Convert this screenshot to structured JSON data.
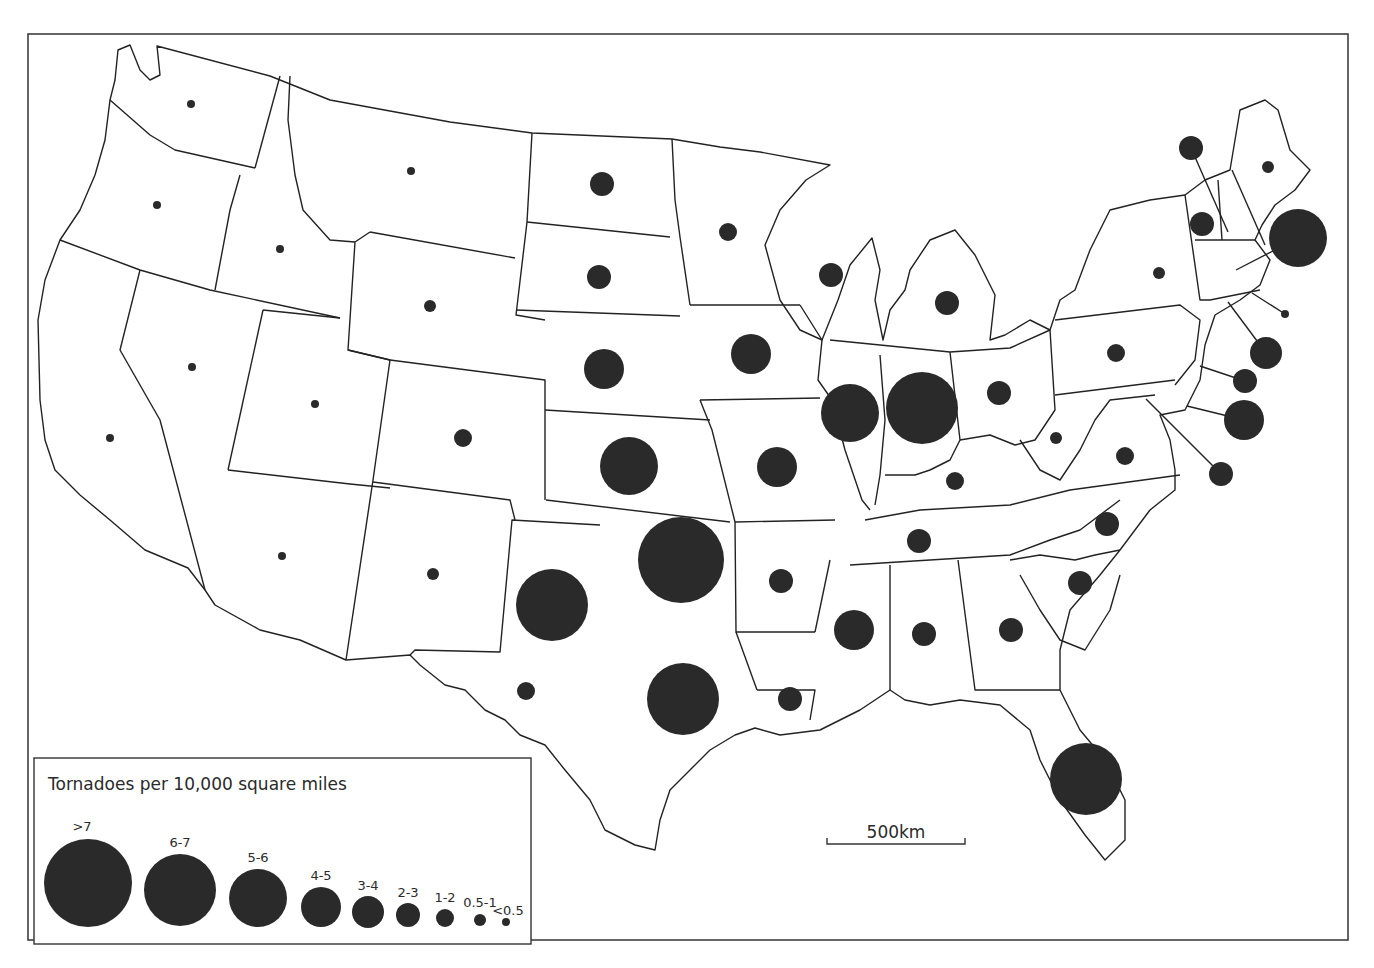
{
  "legend": {
    "title": "Tornadoes per 10,000 square miles",
    "classes": [
      {
        "label": ">7",
        "cx": 88,
        "cy": 883,
        "r": 44,
        "lx": 82,
        "ly": 831
      },
      {
        "label": "6-7",
        "cx": 180,
        "cy": 890,
        "r": 36,
        "lx": 180,
        "ly": 847
      },
      {
        "label": "5-6",
        "cx": 258,
        "cy": 898,
        "r": 29,
        "lx": 258,
        "ly": 862
      },
      {
        "label": "4-5",
        "cx": 321,
        "cy": 907,
        "r": 20,
        "lx": 321,
        "ly": 880
      },
      {
        "label": "3-4",
        "cx": 368,
        "cy": 912,
        "r": 16,
        "lx": 368,
        "ly": 890
      },
      {
        "label": "2-3",
        "cx": 408,
        "cy": 915,
        "r": 12,
        "lx": 408,
        "ly": 897
      },
      {
        "label": "1-2",
        "cx": 445,
        "cy": 918,
        "r": 9,
        "lx": 445,
        "ly": 902
      },
      {
        "label": "0.5-1",
        "cx": 480,
        "cy": 920,
        "r": 6,
        "lx": 480,
        "ly": 907
      },
      {
        "label": "<0.5",
        "cx": 506,
        "cy": 922,
        "r": 4,
        "lx": 508,
        "ly": 915
      }
    ]
  },
  "scale_bar": {
    "label": "500km",
    "x1": 827,
    "x2": 965,
    "y": 844
  },
  "chart_data": {
    "type": "proportional_symbol_map",
    "title": "Tornadoes per 10,000 square miles",
    "legend_classes": [
      ">7",
      "6-7",
      "5-6",
      "4-5",
      "3-4",
      "2-3",
      "1-2",
      "0.5-1",
      "<0.5"
    ],
    "scale": "500km",
    "states": [
      {
        "state": "WA",
        "class": "<0.5",
        "cx": 191,
        "cy": 104,
        "r": 4
      },
      {
        "state": "OR",
        "class": "<0.5",
        "cx": 157,
        "cy": 205,
        "r": 4
      },
      {
        "state": "CA",
        "class": "<0.5",
        "cx": 110,
        "cy": 438,
        "r": 4
      },
      {
        "state": "ID",
        "class": "<0.5",
        "cx": 280,
        "cy": 249,
        "r": 4
      },
      {
        "state": "NV",
        "class": "<0.5",
        "cx": 192,
        "cy": 367,
        "r": 4
      },
      {
        "state": "MT",
        "class": "<0.5",
        "cx": 411,
        "cy": 171,
        "r": 4
      },
      {
        "state": "WY",
        "class": "0.5-1",
        "cx": 430,
        "cy": 306,
        "r": 6
      },
      {
        "state": "UT",
        "class": "<0.5",
        "cx": 315,
        "cy": 404,
        "r": 4
      },
      {
        "state": "AZ",
        "class": "<0.5",
        "cx": 282,
        "cy": 556,
        "r": 4
      },
      {
        "state": "CO",
        "class": "1-2",
        "cx": 463,
        "cy": 438,
        "r": 9
      },
      {
        "state": "NM",
        "class": "0.5-1",
        "cx": 433,
        "cy": 574,
        "r": 6
      },
      {
        "state": "ND",
        "class": "2-3",
        "cx": 602,
        "cy": 184,
        "r": 12
      },
      {
        "state": "SD",
        "class": "2-3",
        "cx": 599,
        "cy": 277,
        "r": 12
      },
      {
        "state": "NE",
        "class": "4-5",
        "cx": 604,
        "cy": 369,
        "r": 20
      },
      {
        "state": "KS",
        "class": "5-6",
        "cx": 629,
        "cy": 466,
        "r": 29
      },
      {
        "state": "OK",
        "class": ">7",
        "cx": 681,
        "cy": 560,
        "r": 43
      },
      {
        "state": "TX (panhandle)",
        "class": "6-7",
        "cx": 552,
        "cy": 605,
        "r": 36
      },
      {
        "state": "TX (east)",
        "class": "6-7",
        "cx": 683,
        "cy": 699,
        "r": 36
      },
      {
        "state": "TX (west)",
        "class": "1-2",
        "cx": 526,
        "cy": 691,
        "r": 9
      },
      {
        "state": "MN",
        "class": "1-2",
        "cx": 728,
        "cy": 232,
        "r": 9
      },
      {
        "state": "IA",
        "class": "4-5",
        "cx": 751,
        "cy": 354,
        "r": 20
      },
      {
        "state": "MO",
        "class": "4-5",
        "cx": 777,
        "cy": 467,
        "r": 20
      },
      {
        "state": "AR",
        "class": "2-3",
        "cx": 781,
        "cy": 581,
        "r": 12
      },
      {
        "state": "LA",
        "class": "2-3",
        "cx": 790,
        "cy": 699,
        "r": 12
      },
      {
        "state": "WI",
        "class": "2-3",
        "cx": 831,
        "cy": 275,
        "r": 12
      },
      {
        "state": "IL",
        "class": "5-6",
        "cx": 850,
        "cy": 413,
        "r": 29
      },
      {
        "state": "IN",
        "class": "6-7",
        "cx": 922,
        "cy": 408,
        "r": 36
      },
      {
        "state": "MI",
        "class": "2-3",
        "cx": 947,
        "cy": 303,
        "r": 12
      },
      {
        "state": "OH",
        "class": "2-3",
        "cx": 999,
        "cy": 393,
        "r": 12
      },
      {
        "state": "KY",
        "class": "1-2",
        "cx": 955,
        "cy": 481,
        "r": 9
      },
      {
        "state": "TN",
        "class": "2-3",
        "cx": 919,
        "cy": 541,
        "r": 12
      },
      {
        "state": "MS",
        "class": "4-5",
        "cx": 854,
        "cy": 630,
        "r": 20
      },
      {
        "state": "AL",
        "class": "2-3",
        "cx": 924,
        "cy": 634,
        "r": 12
      },
      {
        "state": "GA",
        "class": "2-3",
        "cx": 1011,
        "cy": 630,
        "r": 12
      },
      {
        "state": "FL",
        "class": "6-7",
        "cx": 1086,
        "cy": 779,
        "r": 36
      },
      {
        "state": "SC",
        "class": "2-3",
        "cx": 1080,
        "cy": 583,
        "r": 12
      },
      {
        "state": "NC",
        "class": "2-3",
        "cx": 1107,
        "cy": 524,
        "r": 12
      },
      {
        "state": "VA",
        "class": "1-2",
        "cx": 1125,
        "cy": 456,
        "r": 9
      },
      {
        "state": "WV",
        "class": "0.5-1",
        "cx": 1056,
        "cy": 438,
        "r": 6
      },
      {
        "state": "PA",
        "class": "1-2",
        "cx": 1116,
        "cy": 353,
        "r": 9
      },
      {
        "state": "NY",
        "class": "0.5-1",
        "cx": 1159,
        "cy": 273,
        "r": 6
      },
      {
        "state": "VT",
        "class": "2-3",
        "cx": 1202,
        "cy": 224,
        "r": 12
      },
      {
        "state": "NH",
        "class": "2-3",
        "cx": 1191,
        "cy": 148,
        "r": 12,
        "leader": [
          1228,
          232
        ]
      },
      {
        "state": "ME",
        "class": "0.5-1",
        "cx": 1268,
        "cy": 167,
        "r": 6
      },
      {
        "state": "MA",
        "class": "5-6",
        "cx": 1298,
        "cy": 238,
        "r": 29,
        "leader": [
          1236,
          270
        ]
      },
      {
        "state": "RI",
        "class": "<0.5",
        "cx": 1285,
        "cy": 314,
        "r": 4,
        "leader": [
          1252,
          293
        ]
      },
      {
        "state": "CT",
        "class": "3-4",
        "cx": 1266,
        "cy": 353,
        "r": 16,
        "leader": [
          1228,
          302
        ]
      },
      {
        "state": "NJ",
        "class": "2-3",
        "cx": 1245,
        "cy": 381,
        "r": 12,
        "leader": [
          1200,
          366
        ]
      },
      {
        "state": "DE",
        "class": "4-5",
        "cx": 1244,
        "cy": 420,
        "r": 20,
        "leader": [
          1187,
          406
        ]
      },
      {
        "state": "MD",
        "class": "2-3",
        "cx": 1221,
        "cy": 474,
        "r": 12,
        "leader": [
          1146,
          399
        ]
      }
    ]
  }
}
